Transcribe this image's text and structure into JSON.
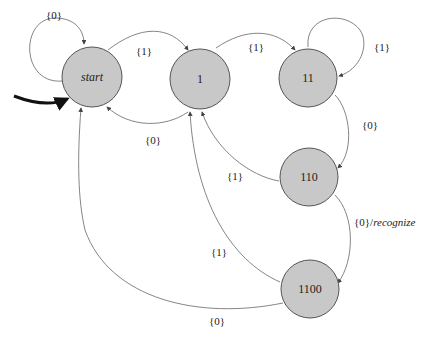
{
  "diagram": {
    "type": "finite-state-machine",
    "states": [
      {
        "id": "start",
        "label": "start",
        "italic": true,
        "initial": true
      },
      {
        "id": "s1",
        "label": "1"
      },
      {
        "id": "s11",
        "label": "11"
      },
      {
        "id": "s110",
        "label": "110"
      },
      {
        "id": "s1100",
        "label": "1100"
      }
    ],
    "transitions": [
      {
        "from": "start",
        "to": "start",
        "label": "{0}"
      },
      {
        "from": "start",
        "to": "s1",
        "label": "{1}"
      },
      {
        "from": "s1",
        "to": "start",
        "label": "{0}"
      },
      {
        "from": "s1",
        "to": "s11",
        "label": "{1}"
      },
      {
        "from": "s11",
        "to": "s11",
        "label": "{1}"
      },
      {
        "from": "s11",
        "to": "s110",
        "label": "{0}"
      },
      {
        "from": "s110",
        "to": "s1",
        "label": "{1}"
      },
      {
        "from": "s110",
        "to": "s1100",
        "label": "{0}/",
        "action": "recognize"
      },
      {
        "from": "s1100",
        "to": "s1",
        "label": "{1}"
      },
      {
        "from": "s1100",
        "to": "start",
        "label": "{0}"
      }
    ]
  }
}
